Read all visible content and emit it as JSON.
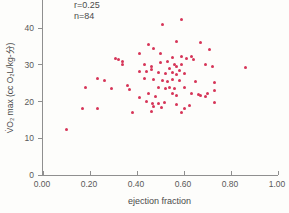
{
  "figure": {
    "annotation": {
      "r_label": "r=0.25",
      "n_label": "n=84"
    }
  },
  "colors": {
    "marker": "#d63558",
    "axis": "#8f8f8f",
    "text": "#4a4a4a",
    "background": "#fdfdfb"
  },
  "chart_data": {
    "type": "scatter",
    "title": "",
    "xlabel": "ejection fraction",
    "ylabel": "V̇O₂ max (cc O₂L/kg-分)",
    "annotations": [
      "r=0.25",
      "n=84"
    ],
    "xlim": [
      0,
      1.0
    ],
    "ylim": [
      0,
      47
    ],
    "grid": false,
    "legend": null,
    "marker_color": "#d63558",
    "xticks": {
      "values": [
        0,
        0.2,
        0.4,
        0.6,
        0.8,
        1.0
      ],
      "labels": [
        "0.00",
        "0.20",
        "0.40",
        "0.60",
        "0.80",
        "1.00"
      ]
    },
    "yticks": {
      "values": [
        0,
        10,
        20,
        30,
        40
      ],
      "labels": [
        "0",
        "10",
        "20",
        "30",
        "40"
      ]
    },
    "series": [
      {
        "name": "patients",
        "points": [
          [
            0.1,
            12.3
          ],
          [
            0.17,
            18.1
          ],
          [
            0.23,
            18.1
          ],
          [
            0.18,
            23.8
          ],
          [
            0.29,
            23.6
          ],
          [
            0.23,
            26.2
          ],
          [
            0.26,
            25.7
          ],
          [
            0.31,
            31.8
          ],
          [
            0.32,
            31.4
          ],
          [
            0.34,
            31.0
          ],
          [
            0.34,
            30.1
          ],
          [
            0.38,
            17.0
          ],
          [
            0.41,
            21.1
          ],
          [
            0.36,
            24.4
          ],
          [
            0.37,
            23.2
          ],
          [
            0.59,
            42.5
          ],
          [
            0.51,
            41.0
          ],
          [
            0.57,
            36.5
          ],
          [
            0.67,
            36.0
          ],
          [
            0.45,
            35.6
          ],
          [
            0.47,
            34.5
          ],
          [
            0.5,
            33.2
          ],
          [
            0.41,
            33.2
          ],
          [
            0.71,
            34.2
          ],
          [
            0.55,
            32.1
          ],
          [
            0.59,
            32.3
          ],
          [
            0.61,
            31.8
          ],
          [
            0.63,
            32.3
          ],
          [
            0.64,
            31.6
          ],
          [
            0.53,
            31.0
          ],
          [
            0.5,
            30.7
          ],
          [
            0.43,
            30.1
          ],
          [
            0.46,
            29.6
          ],
          [
            0.56,
            30.1
          ],
          [
            0.57,
            29.6
          ],
          [
            0.59,
            30.1
          ],
          [
            0.69,
            30.1
          ],
          [
            0.72,
            29.6
          ],
          [
            0.49,
            27.9
          ],
          [
            0.52,
            27.7
          ],
          [
            0.55,
            27.9
          ],
          [
            0.57,
            27.4
          ],
          [
            0.6,
            27.7
          ],
          [
            0.43,
            26.3
          ],
          [
            0.47,
            26.0
          ],
          [
            0.51,
            25.8
          ],
          [
            0.53,
            25.5
          ],
          [
            0.55,
            26.0
          ],
          [
            0.58,
            25.8
          ],
          [
            0.65,
            25.5
          ],
          [
            0.73,
            25.2
          ],
          [
            0.41,
            28.3
          ],
          [
            0.44,
            28.2
          ],
          [
            0.46,
            28.8
          ],
          [
            0.49,
            23.8
          ],
          [
            0.52,
            23.6
          ],
          [
            0.54,
            23.8
          ],
          [
            0.56,
            23.6
          ],
          [
            0.6,
            23.8
          ],
          [
            0.45,
            22.2
          ],
          [
            0.55,
            22.2
          ],
          [
            0.57,
            21.6
          ],
          [
            0.63,
            22.2
          ],
          [
            0.66,
            21.9
          ],
          [
            0.7,
            22.2
          ],
          [
            0.44,
            20.0
          ],
          [
            0.465,
            19.4
          ],
          [
            0.515,
            19.8
          ],
          [
            0.57,
            19.2
          ],
          [
            0.625,
            18.9
          ],
          [
            0.73,
            19.7
          ],
          [
            0.47,
            18.6
          ],
          [
            0.49,
            19.6
          ],
          [
            0.505,
            18.4
          ],
          [
            0.46,
            17.3
          ],
          [
            0.6,
            18.1
          ],
          [
            0.59,
            17.0
          ],
          [
            0.67,
            21.6
          ],
          [
            0.69,
            21.4
          ],
          [
            0.73,
            23.0
          ],
          [
            0.86,
            29.3
          ],
          [
            0.54,
            29.0
          ],
          [
            0.48,
            21.4
          ],
          [
            0.58,
            28.5
          ]
        ]
      }
    ]
  }
}
